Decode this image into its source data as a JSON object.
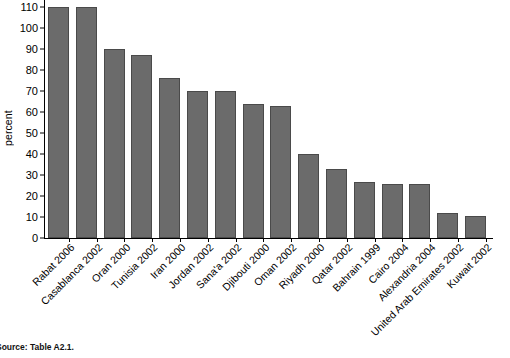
{
  "chart_data": {
    "type": "bar",
    "title": "",
    "xlabel": "",
    "ylabel": "percent",
    "ylim": [
      0,
      110
    ],
    "ytick_step": 10,
    "yticks": [
      0,
      10,
      20,
      30,
      40,
      50,
      60,
      70,
      80,
      90,
      100,
      110
    ],
    "grid": false,
    "legend": null,
    "bar_color": "#6b6b6b",
    "bar_edge_color": "#4a4a4a",
    "clipped_note": "First two bars reach the top of the axis (values at or above 110).",
    "categories": [
      "Rabat 2006",
      "Casablanca 2002",
      "Oran 2000",
      "Tunisia 2002",
      "Iran 2000",
      "Jordan 2002",
      "Sana'a 2002",
      "Djibouti 2000",
      "Oman 2002",
      "Riyadh 2000",
      "Qatar 2002",
      "Bahrain 1999",
      "Cairo 2004",
      "Alexandria 2004",
      "United Arab Emirates 2002",
      "Kuwait 2002"
    ],
    "values": [
      110,
      110,
      90,
      87,
      76,
      70,
      70,
      64,
      63,
      40,
      33,
      26.5,
      25.5,
      25.5,
      12,
      10.5
    ]
  },
  "footnote": {
    "source": "Source: Table A2.1."
  }
}
